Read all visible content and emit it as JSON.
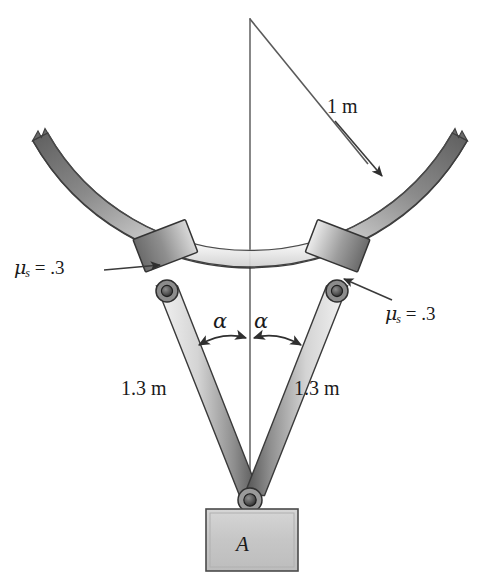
{
  "figure": {
    "domain": "engineering-statics-diagram"
  },
  "labels": {
    "radius": "1 m",
    "mu_left": {
      "symbol": "μ",
      "subscript": "s",
      "equals": "=",
      "value": ".3",
      "full": "μₛ = .3"
    },
    "mu_right": {
      "symbol": "μ",
      "subscript": "s",
      "equals": "=",
      "value": ".3",
      "full": "μₛ = .3"
    },
    "alpha_left": "α",
    "alpha_right": "α",
    "link_length_left": "1.3 m",
    "link_length_right": "1.3 m",
    "block_name": "A"
  },
  "colors": {
    "background": "#ffffff",
    "outline": "#3a3a3a",
    "leader_line": "#4a4a4a",
    "arc_dark": "#6f6f6f",
    "arc_mid": "#9a9a9a",
    "arc_light": "#f2f2f2",
    "collar_dark": "#707070",
    "collar_light": "#e8e8e8",
    "link_light": "#f0f0f0",
    "link_dark": "#5f5f5f",
    "block_fill": "#c9c9c9",
    "pin_dark": "#2b2b2b",
    "text": "#1a1a1a"
  },
  "geometry": {
    "circle_center": {
      "x": 250,
      "y": 18
    },
    "circle_radius_px": 243,
    "arc_band_thickness_px": 17,
    "centerline": {
      "x": 250,
      "y_top": 18,
      "y_bottom": 500
    },
    "radius_leader": {
      "x1": 250,
      "y1": 18,
      "x2": 371,
      "y2": 167
    },
    "collar_left_angle_deg": 249,
    "collar_right_angle_deg": 291,
    "pin_left": {
      "x": 167,
      "y": 291
    },
    "pin_right": {
      "x": 337,
      "y": 291
    },
    "pin_bottom": {
      "x": 250,
      "y": 500
    },
    "block": {
      "x": 206,
      "y": 509,
      "width": 92,
      "height": 62
    }
  }
}
